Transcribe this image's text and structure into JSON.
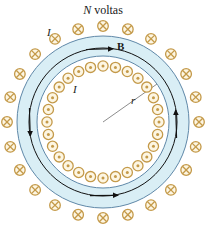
{
  "figure": {
    "type": "toroid-magnetic-field-diagram",
    "title_prefix": "N",
    "title_suffix": " voltas",
    "title_full": "N voltas",
    "center": {
      "x": 103,
      "y": 122
    },
    "geometry": {
      "band_outer_radius": 86,
      "band_inner_radius": 66,
      "b_circle_radius": 74,
      "inner_dot_ring_radius": 56,
      "outer_cross_ring_radius": 96,
      "dot_symbol_count": 28,
      "cross_symbol_count": 24,
      "radius_line_angle_deg": -35
    },
    "colors": {
      "band_fill": "#d9eef5",
      "band_stroke": "#5f88a8",
      "symbol_stroke": "#c49a4a",
      "symbol_fill": "#fdf6e3",
      "field_line": "#111111",
      "radius_line": "#7f7f7f",
      "text": "#1a1a1a",
      "background": "#ffffff"
    },
    "labels": {
      "current_outer": "I",
      "current_inner": "I",
      "field": "B",
      "radius": "r"
    },
    "arrows": {
      "top": "clockwise-right",
      "left": "down",
      "right": "up",
      "bottom": "right"
    },
    "symbols": {
      "cross": "field-into-page",
      "dot": "field-out-of-page"
    }
  }
}
